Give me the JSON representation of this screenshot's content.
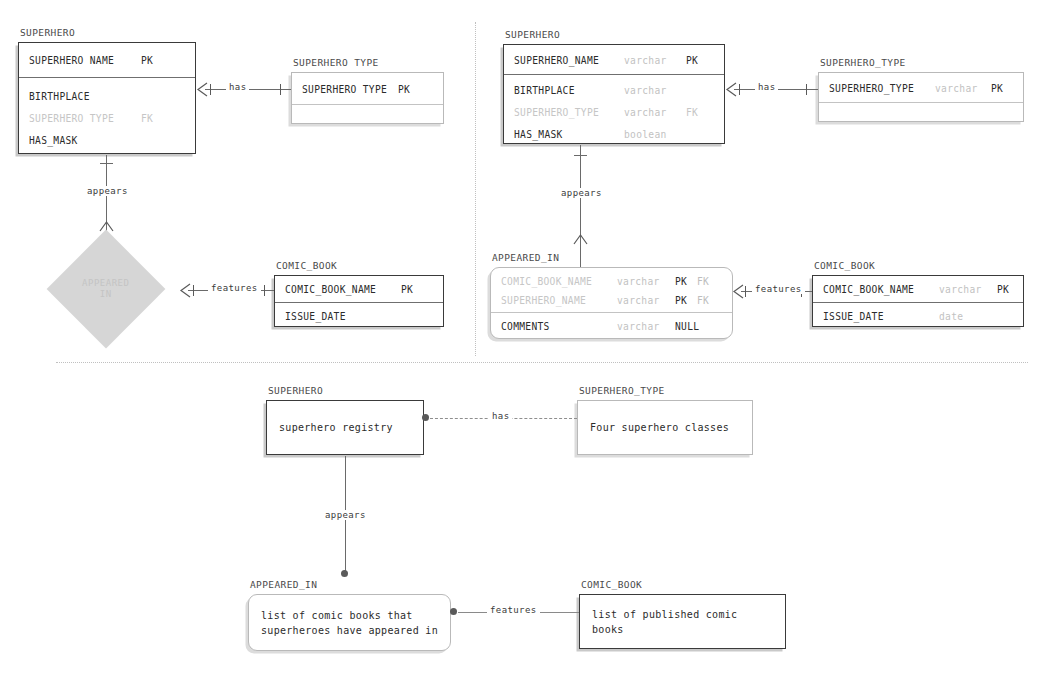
{
  "diagram": {
    "colors": {
      "ink": "#2b2b2b",
      "line": "#6a6a6a",
      "dim": "#c6c6c6",
      "diamond_fill": "#d6d6d6",
      "shadow": "#c9c9c9"
    }
  },
  "panel_conceptual": {
    "superhero": {
      "caption": "SUPERHERO",
      "pk_attrs": [
        {
          "name": "SUPERHERO NAME",
          "type": "",
          "key": "PK",
          "key2": "",
          "dim": false
        }
      ],
      "attrs": [
        {
          "name": "BIRTHPLACE",
          "type": "",
          "key": "",
          "key2": "",
          "dim": false
        },
        {
          "name": "SUPERHERO TYPE",
          "type": "",
          "key": "FK",
          "key2": "",
          "dim": true
        },
        {
          "name": "HAS_MASK",
          "type": "",
          "key": "",
          "key2": "",
          "dim": false
        }
      ]
    },
    "superhero_type": {
      "caption": "SUPERHERO TYPE",
      "pk_attrs": [
        {
          "name": "SUPERHERO TYPE",
          "type": "",
          "key": "PK",
          "key2": "",
          "dim": false
        }
      ],
      "attrs": []
    },
    "appeared_in_diamond": {
      "label": "APPEARED\nIN"
    },
    "comic_book": {
      "caption": "COMIC_BOOK",
      "pk_attrs": [
        {
          "name": "COMIC_BOOK_NAME",
          "type": "",
          "key": "PK",
          "key2": "",
          "dim": false
        }
      ],
      "attrs": [
        {
          "name": "ISSUE_DATE",
          "type": "",
          "key": "",
          "key2": "",
          "dim": false
        }
      ]
    },
    "rel_has": "has",
    "rel_appears": "appears",
    "rel_features": "features"
  },
  "panel_logical": {
    "superhero": {
      "caption": "SUPERHERO",
      "pk_attrs": [
        {
          "name": "SUPERHERO_NAME",
          "type": "varchar",
          "key": "PK",
          "key2": "",
          "dim": false
        }
      ],
      "attrs": [
        {
          "name": "BIRTHPLACE",
          "type": "varchar",
          "key": "",
          "key2": "",
          "dim": false
        },
        {
          "name": "SUPERHERO_TYPE",
          "type": "varchar",
          "key": "FK",
          "key2": "",
          "dim": true
        },
        {
          "name": "HAS_MASK",
          "type": "boolean",
          "key": "",
          "key2": "",
          "dim": false
        }
      ]
    },
    "superhero_type": {
      "caption": "SUPERHERO_TYPE",
      "pk_attrs": [
        {
          "name": "SUPERHERO_TYPE",
          "type": "varchar",
          "key": "PK",
          "key2": "",
          "dim": false
        }
      ],
      "attrs": []
    },
    "appeared_in": {
      "caption": "APPEARED_IN",
      "pk_attrs": [
        {
          "name": "COMIC_BOOK_NAME",
          "type": "varchar",
          "key": "PK",
          "key2": "FK",
          "dim": true
        },
        {
          "name": "SUPERHERO_NAME",
          "type": "varchar",
          "key": "PK",
          "key2": "FK",
          "dim": true
        }
      ],
      "attrs": [
        {
          "name": "COMMENTS",
          "type": "varchar",
          "key": "NULL",
          "key2": "",
          "dim": false
        }
      ]
    },
    "comic_book": {
      "caption": "COMIC_BOOK",
      "pk_attrs": [
        {
          "name": "COMIC_BOOK_NAME",
          "type": "varchar",
          "key": "PK",
          "key2": "",
          "dim": false
        }
      ],
      "attrs": [
        {
          "name": "ISSUE_DATE",
          "type": "date",
          "key": "",
          "key2": "",
          "dim": false
        }
      ]
    },
    "rel_has": "has",
    "rel_appears": "appears",
    "rel_features": "features"
  },
  "panel_descriptive": {
    "superhero": {
      "caption": "SUPERHERO",
      "text": "superhero registry"
    },
    "superhero_type": {
      "caption": "SUPERHERO_TYPE",
      "text": "Four superhero classes"
    },
    "appeared_in": {
      "caption": "APPEARED_IN",
      "text": "list of comic books that\nsuperheroes have appeared in"
    },
    "comic_book": {
      "caption": "COMIC_BOOK",
      "text": "list of published comic books"
    },
    "rel_has": "has",
    "rel_appears": "appears",
    "rel_features": "features"
  }
}
